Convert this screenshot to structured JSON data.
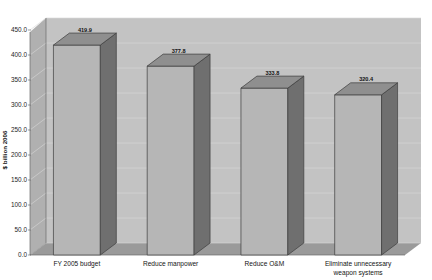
{
  "chart_data": {
    "type": "bar",
    "title": "",
    "subtitle": "",
    "xlabel": "",
    "ylabel": "$ billion 2006",
    "categories": [
      "FY 2005 budget",
      "Reduce manpower",
      "Reduce O&M",
      "Eliminate unnecessary weapon systems"
    ],
    "category_lines": [
      [
        "FY 2005 budget"
      ],
      [
        "Reduce manpower"
      ],
      [
        "Reduce O&M"
      ],
      [
        "Eliminate unnecessary",
        "weapon systems"
      ]
    ],
    "values": [
      419.9,
      377.8,
      333.8,
      320.4
    ],
    "value_labels": [
      "419.9",
      "377.8",
      "333.8",
      "320.4"
    ],
    "ylim": [
      0,
      450
    ],
    "ytick_values": [
      0,
      50,
      100,
      150,
      200,
      250,
      300,
      350,
      400,
      450
    ],
    "ytick_labels": [
      "0.0",
      "50.0",
      "100.0",
      "150.0",
      "200.0",
      "250.0",
      "300.0",
      "350.0",
      "400.0",
      "450.0"
    ],
    "grid": true,
    "grid_axis": "y",
    "legend": false,
    "legend_position": "none",
    "three_d": true,
    "annotations": []
  },
  "colors": {
    "bar_front": "#b6b6b6",
    "bar_side": "#6f6f6f",
    "bar_top": "#8f8f8f",
    "bar_outline": "#3d3d3d",
    "wall_back": "#c3c3c3",
    "wall_left": "#b0b0b0",
    "floor": "#9a9a9a",
    "gridline": "#d8d8d8",
    "axis_line": "#5a5a5a",
    "text": "#141414",
    "page_background": "#ffffff"
  }
}
